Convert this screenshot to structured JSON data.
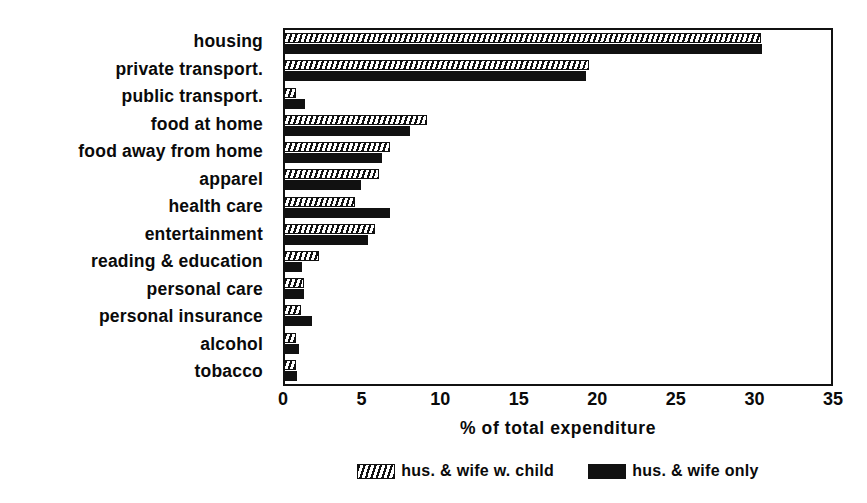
{
  "chart_data": {
    "type": "bar",
    "orientation": "horizontal",
    "title": "",
    "xlabel": "% of total expenditure",
    "ylabel": "",
    "xlim": [
      0,
      35
    ],
    "xticks": [
      0,
      5,
      10,
      15,
      20,
      25,
      30,
      35
    ],
    "grid": false,
    "legend_position": "bottom",
    "categories": [
      "housing",
      "private transport.",
      "public transport.",
      "food at home",
      "food away from home",
      "apparel",
      "health care",
      "entertainment",
      "reading & education",
      "personal care",
      "personal insurance",
      "alcohol",
      "tobacco"
    ],
    "series": [
      {
        "name": "hus. & wife w. child",
        "style": "hatched",
        "color": "#111111",
        "values": [
          30.5,
          19.5,
          0.7,
          9.1,
          6.7,
          6.0,
          4.5,
          5.8,
          2.2,
          1.2,
          1.0,
          0.7,
          0.7
        ]
      },
      {
        "name": "hus. & wife only",
        "style": "solid",
        "color": "#111111",
        "values": [
          30.6,
          19.3,
          1.3,
          8.0,
          6.2,
          4.9,
          6.7,
          5.3,
          1.1,
          1.2,
          1.7,
          0.9,
          0.8
        ]
      }
    ]
  },
  "axis": {
    "x_tick_labels": [
      "0",
      "5",
      "10",
      "15",
      "20",
      "25",
      "30",
      "35"
    ],
    "x_axis_title": "% of total expenditure"
  },
  "legend": {
    "items": [
      {
        "label": "hus. & wife w. child",
        "swatch": "hatched-swatch-icon"
      },
      {
        "label": "hus. & wife only",
        "swatch": "solid-swatch-icon"
      }
    ]
  }
}
